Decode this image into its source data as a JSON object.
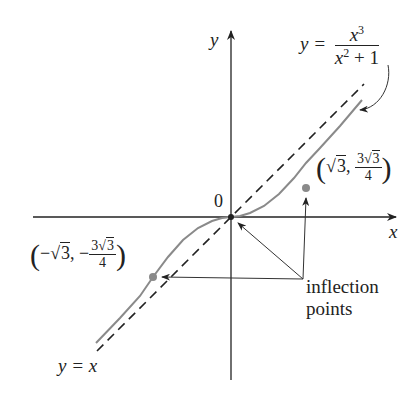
{
  "diagram": {
    "axes": {
      "x_label": "x",
      "y_label": "y",
      "origin_label": "0"
    },
    "curve": {
      "equation_lhs": "y =",
      "numerator": "x",
      "numerator_exp": "3",
      "denominator": "x",
      "denominator_exp": "2",
      "denominator_rest": " + 1"
    },
    "asymptote": {
      "label": "y = x"
    },
    "points": {
      "right": {
        "x_sign": "",
        "x_val": "3",
        "y_sign": "",
        "y_num": "3",
        "y_num_sqrt": "3",
        "y_den": "4"
      },
      "left": {
        "x_sign": "−",
        "x_val": "3",
        "y_sign": "−",
        "y_num": "3",
        "y_num_sqrt": "3",
        "y_den": "4"
      }
    },
    "annotation": {
      "line1": "inflection",
      "line2": "points"
    },
    "colors": {
      "curve": "#8a8a8a",
      "axes": "#222222",
      "dot": "#8a8a8a"
    }
  }
}
